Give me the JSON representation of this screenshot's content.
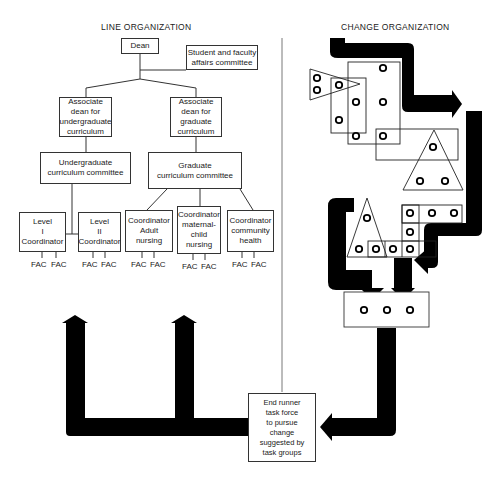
{
  "line_organization": {
    "title": "LINE ORGANIZATION",
    "dean": "Dean",
    "committee": "Student and faculty\naffairs committee",
    "assoc_undergrad": "Associate\ndean for\nundergraduate\ncurriculum",
    "assoc_grad": "Associate\ndean for\ngraduate\ncurriculum",
    "undergrad_committee": "Undergraduate\ncurriculum committee",
    "grad_committee": "Graduate\ncurriculum committee",
    "coordinators": [
      {
        "label": "Level\nI\nCoordinator"
      },
      {
        "label": "Level\nII\nCoordinator"
      },
      {
        "label": "Coordinator\nAdult\nnursing"
      },
      {
        "label": "Coordinator\nmaternal-\nchild\nnursing"
      },
      {
        "label": "Coordinator\ncommunity\nhealth"
      }
    ],
    "fac_label": "FAC"
  },
  "change_organization": {
    "title": "CHANGE ORGANIZATION",
    "task_group_result_circles": 3
  },
  "end_runner": {
    "label": "End runner\ntask force\nto pursue\nchange\nsuggested by\ntask groups"
  },
  "colors": {
    "arrow": "#000000",
    "line": "#333333",
    "background": "#ffffff"
  }
}
